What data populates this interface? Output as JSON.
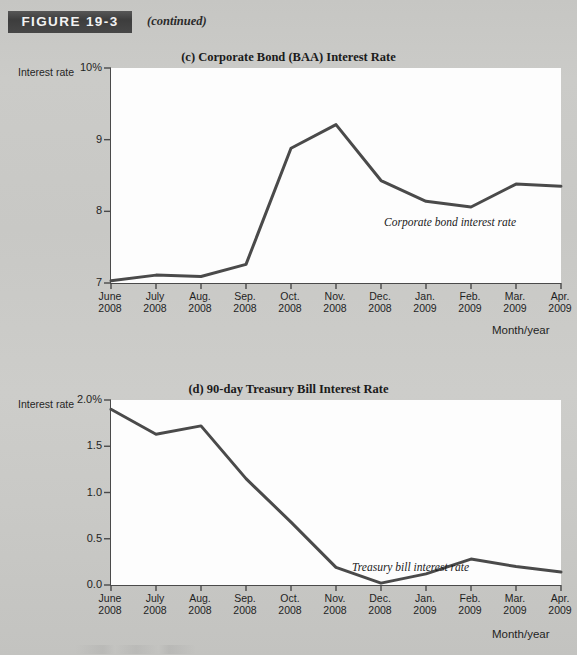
{
  "figure": {
    "badge": "FIGURE 19-3",
    "continued": "(continued)"
  },
  "panel_c": {
    "title": "(c) Corporate Bond (BAA) Interest Rate",
    "y_axis_title": "Interest rate",
    "x_axis_title": "Month/year",
    "annotation": "Corporate bond interest rate",
    "y_ticks": [
      "10%",
      "9",
      "8",
      "7"
    ],
    "x_ticks": [
      {
        "month": "June",
        "year": "2008"
      },
      {
        "month": "July",
        "year": "2008"
      },
      {
        "month": "Aug.",
        "year": "2008"
      },
      {
        "month": "Sep.",
        "year": "2008"
      },
      {
        "month": "Oct.",
        "year": "2008"
      },
      {
        "month": "Nov.",
        "year": "2008"
      },
      {
        "month": "Dec.",
        "year": "2008"
      },
      {
        "month": "Jan.",
        "year": "2009"
      },
      {
        "month": "Feb.",
        "year": "2009"
      },
      {
        "month": "Mar.",
        "year": "2009"
      },
      {
        "month": "Apr.",
        "year": "2009"
      }
    ]
  },
  "panel_d": {
    "title": "(d) 90-day Treasury Bill Interest Rate",
    "y_axis_title": "Interest rate",
    "x_axis_title": "Month/year",
    "annotation": "Treasury bill interest rate",
    "y_ticks": [
      "2.0%",
      "1.5",
      "1.0",
      "0.5",
      "0.0"
    ],
    "x_ticks": [
      {
        "month": "June",
        "year": "2008"
      },
      {
        "month": "July",
        "year": "2008"
      },
      {
        "month": "Aug.",
        "year": "2008"
      },
      {
        "month": "Sep.",
        "year": "2008"
      },
      {
        "month": "Oct.",
        "year": "2008"
      },
      {
        "month": "Nov.",
        "year": "2008"
      },
      {
        "month": "Dec.",
        "year": "2008"
      },
      {
        "month": "Jan.",
        "year": "2009"
      },
      {
        "month": "Feb.",
        "year": "2009"
      },
      {
        "month": "Mar.",
        "year": "2009"
      },
      {
        "month": "Apr.",
        "year": "2009"
      }
    ]
  },
  "colors": {
    "line": "#4a4a4a",
    "axis": "#4a4a4a",
    "plot_background": "#fdfdfd",
    "page_background": "#c8c8c5",
    "badge_background": "#434343",
    "badge_text": "#f2f2f2"
  },
  "chart_data": [
    {
      "type": "line",
      "title": "(c) Corporate Bond (BAA) Interest Rate",
      "xlabel": "Month/year",
      "ylabel": "Interest rate",
      "categories": [
        "June 2008",
        "July 2008",
        "Aug. 2008",
        "Sep. 2008",
        "Oct. 2008",
        "Nov. 2008",
        "Dec. 2008",
        "Jan. 2009",
        "Feb. 2009",
        "Mar. 2009",
        "Apr. 2009"
      ],
      "values": [
        7.03,
        7.11,
        7.09,
        7.26,
        8.88,
        9.21,
        8.43,
        8.14,
        8.06,
        8.38,
        8.35
      ],
      "ylim": [
        7,
        10
      ],
      "yticks": [
        7,
        8,
        9,
        10
      ],
      "ytick_labels": [
        "7",
        "8",
        "9",
        "10%"
      ],
      "grid": false,
      "legend": "none",
      "annotations": [
        "Corporate bond interest rate"
      ]
    },
    {
      "type": "line",
      "title": "(d) 90-day Treasury Bill Interest Rate",
      "xlabel": "Month/year",
      "ylabel": "Interest rate",
      "categories": [
        "June 2008",
        "July 2008",
        "Aug. 2008",
        "Sep. 2008",
        "Oct. 2008",
        "Nov. 2008",
        "Dec. 2008",
        "Jan. 2009",
        "Feb. 2009",
        "Mar. 2009",
        "Apr. 2009"
      ],
      "values": [
        1.9,
        1.63,
        1.72,
        1.15,
        0.68,
        0.19,
        0.02,
        0.12,
        0.28,
        0.2,
        0.14
      ],
      "ylim": [
        0.0,
        2.0
      ],
      "yticks": [
        0.0,
        0.5,
        1.0,
        1.5,
        2.0
      ],
      "ytick_labels": [
        "0.0",
        "0.5",
        "1.0",
        "1.5",
        "2.0%"
      ],
      "grid": false,
      "legend": "none",
      "annotations": [
        "Treasury bill interest rate"
      ]
    }
  ]
}
